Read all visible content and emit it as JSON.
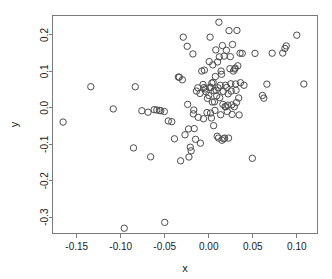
{
  "chart_data": {
    "type": "scatter",
    "title": "",
    "xlabel": "x",
    "ylabel": "y",
    "grid": false,
    "legend": null,
    "xlim": [
      -0.1775,
      0.1235
    ],
    "ylim": [
      -0.345,
      0.2535
    ],
    "xticks": [
      -0.15,
      -0.1,
      -0.05,
      0.0,
      0.05,
      0.1
    ],
    "xticklabels": [
      "-0.15",
      "-0.10",
      "-0.05",
      "0.00",
      "0.05",
      "0.10"
    ],
    "yticks": [
      0.2,
      0.1,
      0.0,
      -0.1,
      -0.2,
      -0.3
    ],
    "yticklabels": [
      "0.2",
      "0.1",
      "0.0",
      "-0.1",
      "-0.2",
      "-0.3"
    ],
    "marker": "open-circle",
    "marker_size": 3.2,
    "marker_color": "#4d4d4d",
    "frame_color": "#7a7a7a",
    "n_points": 128,
    "points": [
      [
        -0.1655,
        -0.039
      ],
      [
        -0.134,
        0.058
      ],
      [
        -0.1085,
        -0.003
      ],
      [
        -0.096,
        -0.3305
      ],
      [
        -0.0855,
        -0.11
      ],
      [
        -0.0835,
        0.0578
      ],
      [
        -0.076,
        -0.008
      ],
      [
        -0.069,
        -0.012
      ],
      [
        -0.066,
        -0.1345
      ],
      [
        -0.062,
        -0.005
      ],
      [
        -0.059,
        -0.006
      ],
      [
        -0.056,
        -0.007
      ],
      [
        -0.0545,
        -0.008
      ],
      [
        -0.0505,
        -0.01
      ],
      [
        -0.05,
        -0.3145
      ],
      [
        -0.046,
        -0.036
      ],
      [
        -0.042,
        -0.038
      ],
      [
        -0.039,
        -0.085
      ],
      [
        -0.0345,
        0.0845
      ],
      [
        -0.0335,
        0.084
      ],
      [
        -0.032,
        -0.1455
      ],
      [
        -0.03,
        0.077
      ],
      [
        -0.029,
        0.194
      ],
      [
        -0.027,
        -0.074
      ],
      [
        -0.0245,
        0.169
      ],
      [
        -0.024,
        0.0095
      ],
      [
        -0.023,
        -0.058
      ],
      [
        -0.0225,
        -0.135
      ],
      [
        -0.021,
        -0.108
      ],
      [
        -0.02,
        -0.118
      ],
      [
        -0.018,
        0.148
      ],
      [
        -0.0175,
        -0.0165
      ],
      [
        -0.017,
        -0.006
      ],
      [
        -0.0165,
        -0.057
      ],
      [
        -0.015,
        -0.0865
      ],
      [
        -0.014,
        0.046
      ],
      [
        -0.0125,
        0.055
      ],
      [
        -0.012,
        -0.026
      ],
      [
        -0.01,
        0.0395
      ],
      [
        -0.0095,
        -0.097
      ],
      [
        -0.008,
        0.101
      ],
      [
        -0.0065,
        0.064
      ],
      [
        -0.006,
        -0.03
      ],
      [
        -0.0055,
        0.0555
      ],
      [
        -0.005,
        0.1035
      ],
      [
        -0.004,
        0.052
      ],
      [
        -0.003,
        0.044
      ],
      [
        -0.002,
        -0.013
      ],
      [
        -0.0015,
        0.026
      ],
      [
        0.0,
        0.034
      ],
      [
        0.0005,
        0.127
      ],
      [
        0.001,
        0.056
      ],
      [
        0.0015,
        0.194
      ],
      [
        0.002,
        -0.0145
      ],
      [
        0.0025,
        0.056
      ],
      [
        0.003,
        -0.028
      ],
      [
        0.0035,
        0.068
      ],
      [
        0.004,
        0.016
      ],
      [
        0.0045,
        0.118
      ],
      [
        0.005,
        0.07
      ],
      [
        0.0055,
        -0.049
      ],
      [
        0.006,
        0.047
      ],
      [
        0.0065,
        0.0165
      ],
      [
        0.007,
        -0.007
      ],
      [
        0.0075,
        0.086
      ],
      [
        0.008,
        0.159
      ],
      [
        0.0085,
        0.048
      ],
      [
        0.009,
        0.033
      ],
      [
        0.0095,
        -0.078
      ],
      [
        0.01,
        0.126
      ],
      [
        0.0105,
        0.055
      ],
      [
        0.011,
        -0.083
      ],
      [
        0.0115,
        0.235
      ],
      [
        0.012,
        0.14
      ],
      [
        0.0125,
        0.028
      ],
      [
        0.013,
        0.062
      ],
      [
        0.0135,
        -0.019
      ],
      [
        0.014,
        0.101
      ],
      [
        0.0145,
        0.092
      ],
      [
        0.015,
        -0.089
      ],
      [
        0.0155,
        0.171
      ],
      [
        0.016,
        0.0095
      ],
      [
        0.0165,
        0.045
      ],
      [
        0.017,
        -0.085
      ],
      [
        0.0175,
        0.142
      ],
      [
        0.018,
        -0.083
      ],
      [
        0.0185,
        0.0035
      ],
      [
        0.019,
        0.062
      ],
      [
        0.0195,
        0.003
      ],
      [
        0.02,
        0.158
      ],
      [
        0.0205,
        0.056
      ],
      [
        0.021,
        -0.01
      ],
      [
        0.0215,
        0.0075
      ],
      [
        0.022,
        0.0385
      ],
      [
        0.0225,
        -0.083
      ],
      [
        0.023,
        0.212
      ],
      [
        0.024,
        0.1075
      ],
      [
        0.0245,
        0.1405
      ],
      [
        0.025,
        0.066
      ],
      [
        0.0255,
        0.046
      ],
      [
        0.026,
        0.008
      ],
      [
        0.0265,
        -0.018
      ],
      [
        0.027,
        0.174
      ],
      [
        0.028,
        0.101
      ],
      [
        0.029,
        0.003
      ],
      [
        0.0295,
        0.1065
      ],
      [
        0.03,
        0.109
      ],
      [
        0.0305,
        0.0655
      ],
      [
        0.031,
        0.048
      ],
      [
        0.0315,
        0.0145
      ],
      [
        0.032,
        0.2125
      ],
      [
        0.033,
        0.1155
      ],
      [
        0.034,
        0.027
      ],
      [
        0.0345,
        -0.0195
      ],
      [
        0.0355,
        0.15
      ],
      [
        0.036,
        0.069
      ],
      [
        0.038,
        0.1495
      ],
      [
        0.04,
        0.062
      ],
      [
        0.0495,
        -0.1385
      ],
      [
        0.0525,
        0.1495
      ],
      [
        0.061,
        0.034
      ],
      [
        0.0625,
        0.0265
      ],
      [
        0.066,
        0.065
      ],
      [
        0.072,
        0.15
      ],
      [
        0.084,
        0.1505
      ],
      [
        0.0865,
        0.163
      ],
      [
        0.088,
        0.17
      ],
      [
        0.1,
        0.1995
      ],
      [
        0.108,
        0.0655
      ]
    ]
  },
  "figure": {
    "background": "#ffffff",
    "width": 332,
    "height": 279
  }
}
